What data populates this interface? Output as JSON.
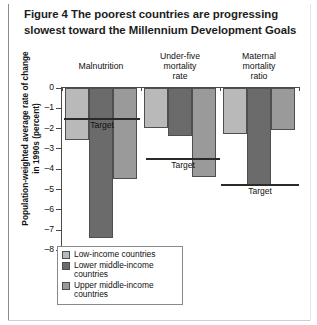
{
  "figure": {
    "number_label": "Figure 4",
    "title_line1": "The poorest countries are progressing",
    "title_line2": "slowest toward the Millennium Development Goals"
  },
  "legend": {
    "items": [
      {
        "label": "Low-income countries",
        "color": "#b9b9b9"
      },
      {
        "label": "Lower middle-income countries",
        "color": "#6b6b6b"
      },
      {
        "label": "Upper middle-income countries",
        "color": "#9a9a9a"
      }
    ]
  },
  "axis": {
    "y_label": "Population-weighted average rate of change in 1990s (percent)",
    "y_ticks": [
      "0",
      "–1",
      "–2",
      "–3",
      "–4",
      "–5",
      "–6",
      "–7",
      "–8"
    ]
  },
  "targets": {
    "label": "Target"
  },
  "chart_data": {
    "type": "bar",
    "title": "Figure 4  The poorest countries are progressing slowest toward the Millennium Development Goals",
    "xlabel": "",
    "ylabel": "Population-weighted average rate of change in 1990s (percent)",
    "ylim": [
      -8,
      0
    ],
    "yticks": [
      0,
      -1,
      -2,
      -3,
      -4,
      -5,
      -6,
      -7,
      -8
    ],
    "grid": false,
    "legend_position": "below-left",
    "categories": [
      "Malnutrition",
      "Under-five mortality rate",
      "Maternal mortality ratio"
    ],
    "series": [
      {
        "name": "Low-income countries",
        "color": "#b9b9b9",
        "values": [
          -2.6,
          -2.0,
          -2.3
        ]
      },
      {
        "name": "Lower middle-income countries",
        "color": "#6b6b6b",
        "values": [
          -7.4,
          -2.4,
          -4.8
        ]
      },
      {
        "name": "Upper middle-income countries",
        "color": "#9a9a9a",
        "values": [
          -4.5,
          -4.4,
          -2.1
        ]
      }
    ],
    "annotations": [
      {
        "text": "Target",
        "category": "Malnutrition",
        "value": -1.55
      },
      {
        "text": "Target",
        "category": "Under-five mortality rate",
        "value": -3.5
      },
      {
        "text": "Target",
        "category": "Maternal mortality ratio",
        "value": -4.8
      }
    ]
  }
}
